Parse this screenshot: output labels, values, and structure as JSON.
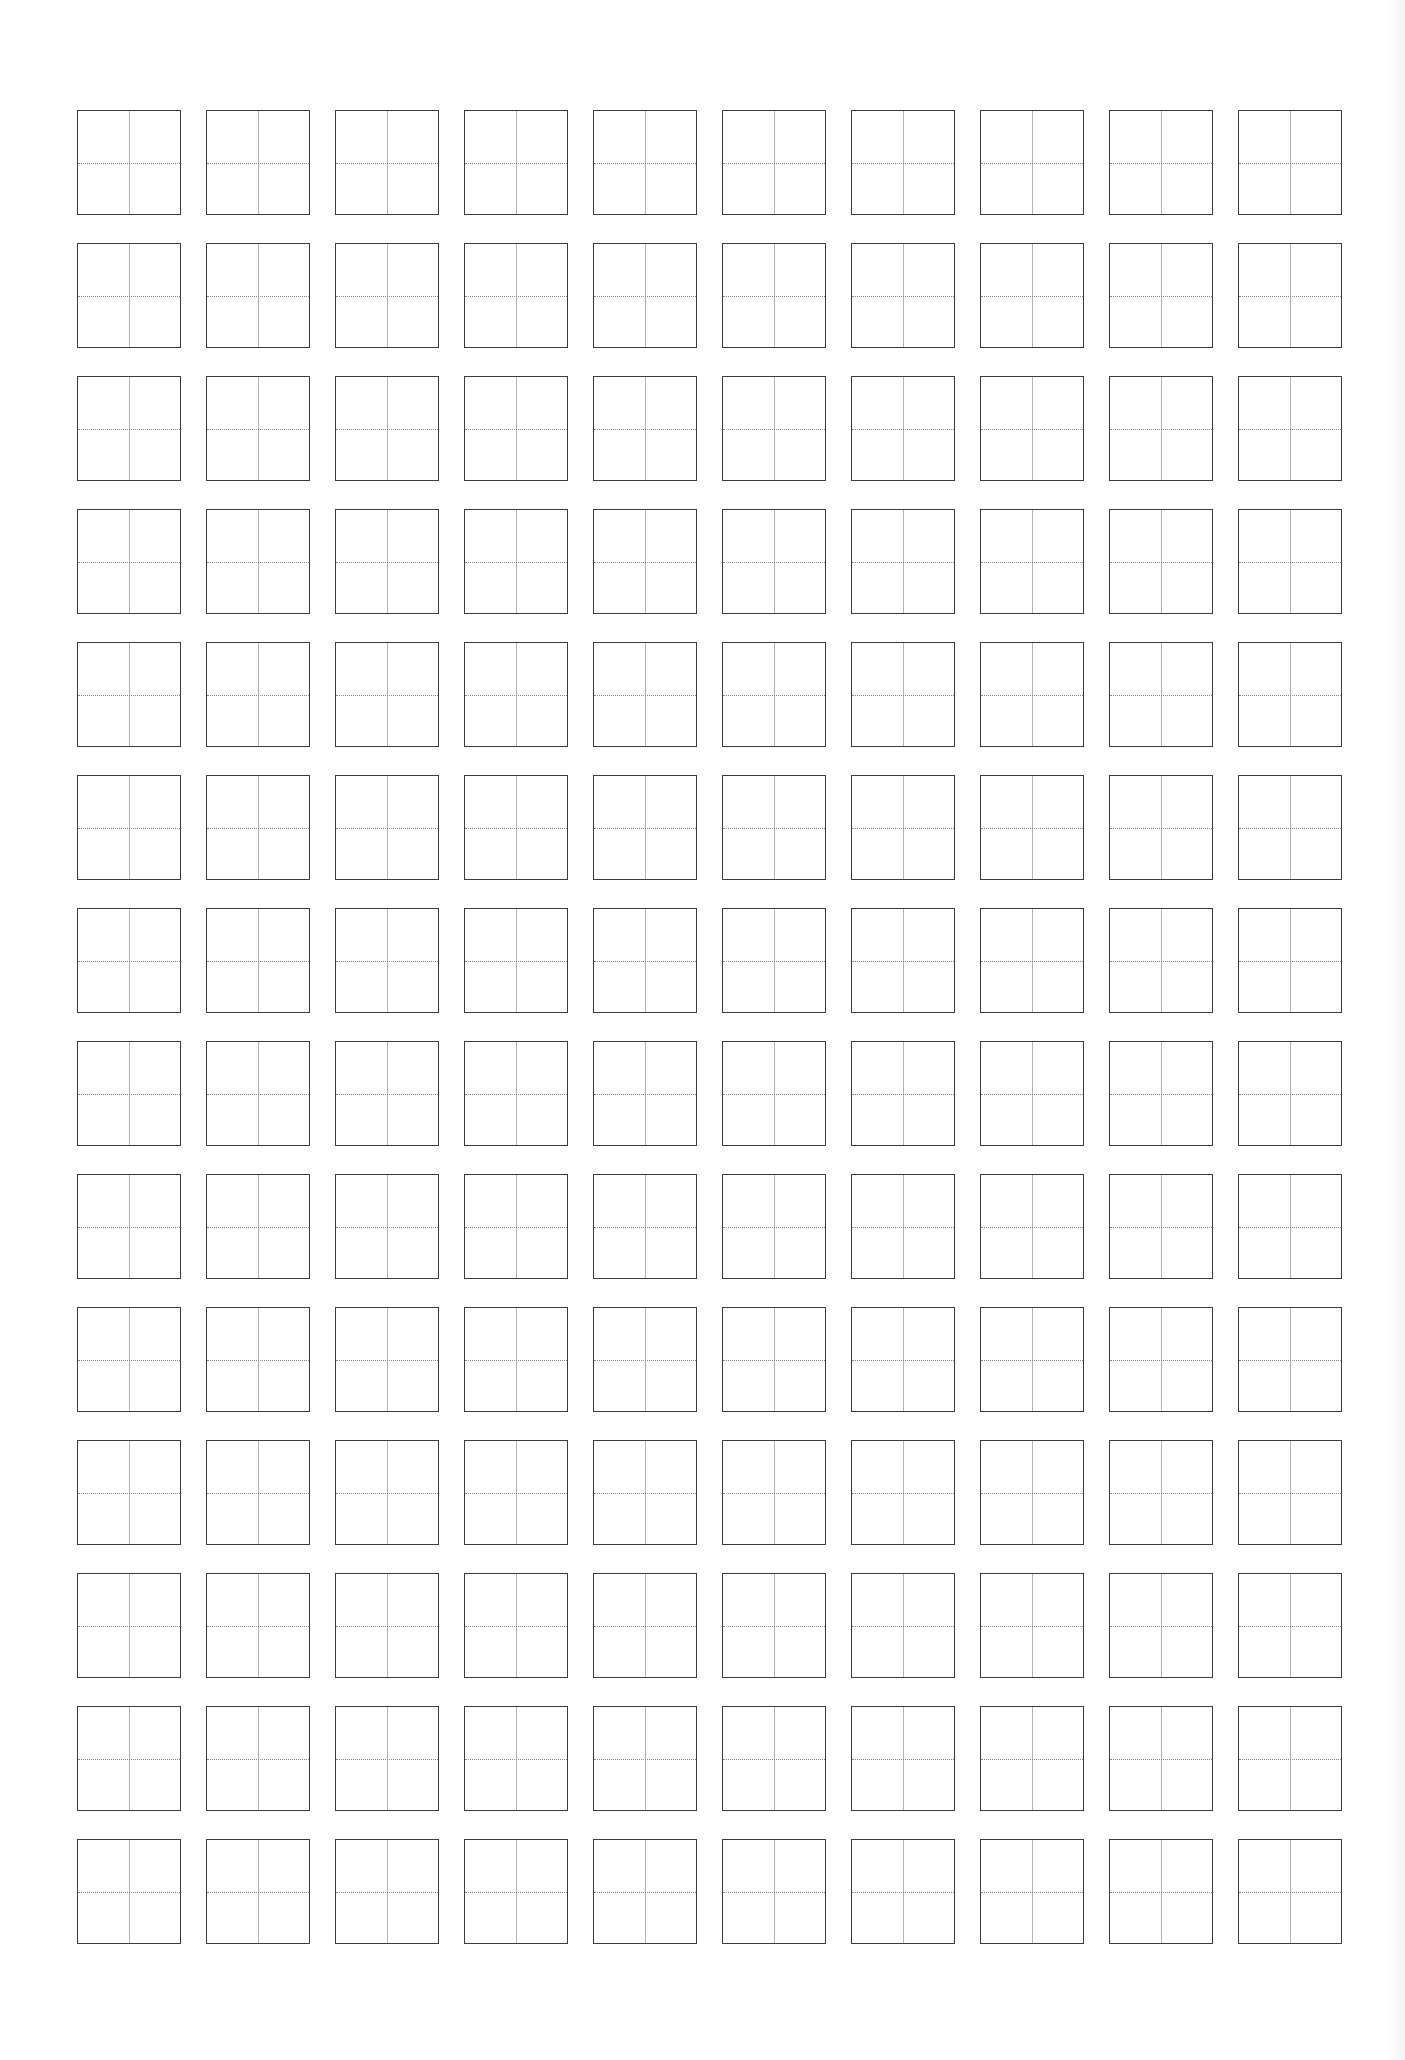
{
  "document": {
    "type": "character-practice-grid",
    "grid": {
      "columns": 10,
      "rows": 14,
      "cell_style": "tian-zi-ge",
      "vertical_guide": "solid",
      "horizontal_guide": "dotted",
      "cells_filled": 0
    },
    "colors": {
      "cell_border": "#3c3c3c",
      "vertical_guide": "#b4b4b4",
      "horizontal_guide": "#8a8a8a",
      "background": "#ffffff"
    }
  }
}
